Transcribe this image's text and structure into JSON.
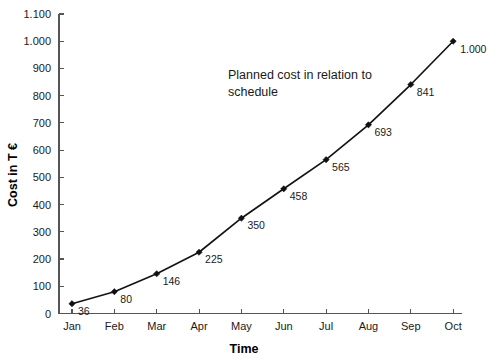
{
  "chart_data": {
    "type": "line",
    "title": "",
    "annotation": [
      "Planned cost in relation to",
      "schedule"
    ],
    "xlabel": "Time",
    "ylabel": "Cost in T €",
    "categories": [
      "Jan",
      "Feb",
      "Mar",
      "Apr",
      "May",
      "Jun",
      "Jul",
      "Aug",
      "Sep",
      "Oct"
    ],
    "values": [
      36,
      80,
      146,
      225,
      350,
      458,
      565,
      693,
      841,
      1000
    ],
    "point_labels": [
      "36",
      "80",
      "146",
      "225",
      "350",
      "458",
      "565",
      "693",
      "841",
      "1.000"
    ],
    "ylim": [
      0,
      1100
    ],
    "ytick_values": [
      0,
      100,
      200,
      300,
      400,
      500,
      600,
      700,
      800,
      900,
      1000,
      1100
    ],
    "ytick_labels": [
      "0",
      "100",
      "200",
      "300",
      "400",
      "500",
      "600",
      "700",
      "800",
      "900",
      "1.000",
      "1.100"
    ],
    "grid": false,
    "legend": "none",
    "series_color": "#141414",
    "axis_color": "#555555",
    "background_color": "#ffffff",
    "marker": "diamond"
  }
}
